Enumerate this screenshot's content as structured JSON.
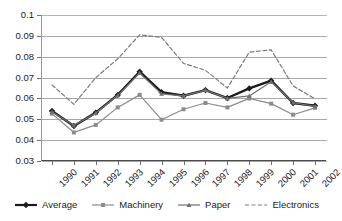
{
  "chart_data": {
    "type": "line",
    "title": "",
    "xlabel": "",
    "ylabel": "",
    "categories": [
      "1990",
      "1991",
      "1992",
      "1993",
      "1994",
      "1995",
      "1996",
      "1997",
      "1998",
      "1999",
      "2000",
      "2001",
      "2002"
    ],
    "ylim": [
      0.03,
      0.1
    ],
    "ytick_labels": [
      "0.1",
      "0.09",
      "0.08",
      "0.07",
      "0.06",
      "0.05",
      "0.04",
      "0.03"
    ],
    "ytick_values": [
      0.1,
      0.09,
      0.08,
      0.07,
      0.06,
      0.05,
      0.04,
      0.03
    ],
    "grid": true,
    "legend_position": "bottom",
    "series": [
      {
        "name": "Average",
        "color": "#1c1c1c",
        "style": "solid",
        "marker": "diamond",
        "width": 2.4,
        "values": [
          0.054,
          0.0468,
          0.0532,
          0.0617,
          0.0728,
          0.063,
          0.0613,
          0.064,
          0.0602,
          0.0648,
          0.0685,
          0.0578,
          0.0565
        ]
      },
      {
        "name": "Machinery",
        "color": "#8c8c8c",
        "style": "solid",
        "marker": "square",
        "width": 1.2,
        "values": [
          0.0527,
          0.0437,
          0.0473,
          0.0557,
          0.0617,
          0.0498,
          0.0548,
          0.0578,
          0.0557,
          0.06,
          0.0575,
          0.0522,
          0.0555
        ]
      },
      {
        "name": "Paper",
        "color": "#6f6f6f",
        "style": "solid",
        "marker": "triangle",
        "width": 1.2,
        "values": [
          0.0536,
          0.047,
          0.053,
          0.0615,
          0.0722,
          0.0622,
          0.0612,
          0.064,
          0.06,
          0.0612,
          0.068,
          0.058,
          0.0562
        ]
      },
      {
        "name": "Electronics",
        "color": "#7a7a7a",
        "style": "dashed",
        "marker": "none",
        "width": 1.2,
        "values": [
          0.0665,
          0.0572,
          0.07,
          0.079,
          0.0905,
          0.0893,
          0.0768,
          0.0735,
          0.065,
          0.0822,
          0.0833,
          0.066,
          0.0598
        ]
      }
    ]
  },
  "legend": {
    "items": [
      {
        "label": "Average"
      },
      {
        "label": "Machinery"
      },
      {
        "label": "Paper"
      },
      {
        "label": "Electronics"
      }
    ]
  }
}
